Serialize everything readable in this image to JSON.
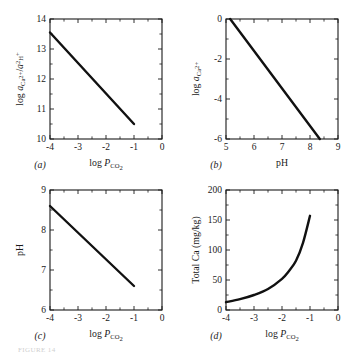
{
  "figure": {
    "background": "#ffffff",
    "ink_color": "#111111",
    "partial_caption": "FIGURE 14"
  },
  "chart_data": [
    {
      "id": "panel-a",
      "type": "line",
      "panel_label": "(a)",
      "title": "",
      "xlabel": "log P_CO2",
      "xlabel_parts": {
        "lead": "log ",
        "italic": "P",
        "sub": "CO2"
      },
      "ylabel": "log a_Ca2+ / a^2_H+",
      "ylabel_parts": {
        "lead": "log ",
        "italic1": "a",
        "sub1": "Ca2+",
        "slash": "/",
        "italic2": "a",
        "sup2": "2",
        "sub2": "H+"
      },
      "xlim": [
        -4,
        0
      ],
      "ylim": [
        10,
        14
      ],
      "xticks": [
        -4,
        -3,
        -2,
        -1,
        0
      ],
      "xticklabels": [
        "-4",
        "-3",
        "-2",
        "-1",
        "0"
      ],
      "yticks": [
        10,
        11,
        12,
        13,
        14
      ],
      "yticklabels": [
        "10",
        "11",
        "12",
        "13",
        "14"
      ],
      "minor_x_per_interval": 1,
      "minor_y_per_interval": 1,
      "grid": false,
      "legend": null,
      "x": [
        -4.0,
        -1.0
      ],
      "values": [
        13.55,
        10.5
      ]
    },
    {
      "id": "panel-b",
      "type": "line",
      "panel_label": "(b)",
      "title": "",
      "xlabel": "pH",
      "xlabel_parts": {
        "lead": "pH",
        "italic": "",
        "sub": ""
      },
      "ylabel": "log a_Ca2+",
      "ylabel_parts": {
        "lead": "log ",
        "italic1": "a",
        "sub1": "Ca2+",
        "slash": "",
        "italic2": "",
        "sup2": "",
        "sub2": ""
      },
      "xlim": [
        5,
        9
      ],
      "ylim": [
        -6,
        0
      ],
      "xticks": [
        5,
        6,
        7,
        8,
        9
      ],
      "xticklabels": [
        "5",
        "6",
        "7",
        "8",
        "9"
      ],
      "yticks": [
        -6,
        -4,
        -2,
        0
      ],
      "yticklabels": [
        "-6",
        "-4",
        "-2",
        "0"
      ],
      "minor_x_per_interval": 1,
      "minor_y_per_interval": 1,
      "grid": false,
      "legend": null,
      "x": [
        5.15,
        8.35
      ],
      "values": [
        0.0,
        -6.0
      ]
    },
    {
      "id": "panel-c",
      "type": "line",
      "panel_label": "(c)",
      "title": "",
      "xlabel": "log P_CO2",
      "xlabel_parts": {
        "lead": "log ",
        "italic": "P",
        "sub": "CO2"
      },
      "ylabel": "pH",
      "ylabel_parts": {
        "lead": "pH",
        "italic1": "",
        "sub1": "",
        "slash": "",
        "italic2": "",
        "sup2": "",
        "sub2": ""
      },
      "xlim": [
        -4,
        0
      ],
      "ylim": [
        6,
        9
      ],
      "xticks": [
        -4,
        -3,
        -2,
        -1,
        0
      ],
      "xticklabels": [
        "-4",
        "-3",
        "-2",
        "-1",
        "0"
      ],
      "yticks": [
        6,
        7,
        8,
        9
      ],
      "yticklabels": [
        "6",
        "7",
        "8",
        "9"
      ],
      "minor_x_per_interval": 1,
      "minor_y_per_interval": 1,
      "grid": false,
      "legend": null,
      "x": [
        -4.0,
        -1.0
      ],
      "values": [
        8.6,
        6.6
      ]
    },
    {
      "id": "panel-d",
      "type": "line",
      "panel_label": "(d)",
      "title": "",
      "xlabel": "log P_CO2",
      "xlabel_parts": {
        "lead": "log ",
        "italic": "P",
        "sub": "CO2"
      },
      "ylabel": "Total Ca (mg/kg)",
      "ylabel_parts": {
        "lead": "Total Ca (mg/kg)",
        "italic1": "",
        "sub1": "",
        "slash": "",
        "italic2": "",
        "sup2": "",
        "sub2": ""
      },
      "xlim": [
        -4,
        0
      ],
      "ylim": [
        0,
        200
      ],
      "xticks": [
        -4,
        -3,
        -2,
        -1,
        0
      ],
      "xticklabels": [
        "-4",
        "-3",
        "-2",
        "-1",
        "0"
      ],
      "yticks": [
        0,
        50,
        100,
        150,
        200
      ],
      "yticklabels": [
        "0",
        "50",
        "100",
        "150",
        "200"
      ],
      "minor_x_per_interval": 1,
      "minor_y_per_interval": 1,
      "grid": false,
      "legend": null,
      "x": [
        -4.0,
        -3.5,
        -3.0,
        -2.5,
        -2.0,
        -1.75,
        -1.5,
        -1.25,
        -1.0
      ],
      "values": [
        13,
        18,
        25,
        35,
        52,
        65,
        82,
        112,
        157
      ]
    }
  ]
}
